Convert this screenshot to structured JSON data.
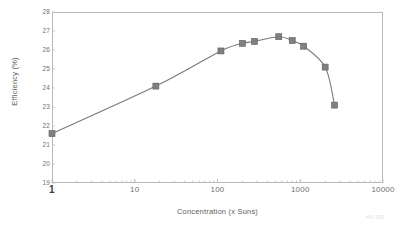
{
  "chart_data": {
    "type": "line",
    "title": "",
    "xlabel": "Concentration (x Suns)",
    "ylabel": "Efficiency (%)",
    "xscale": "log",
    "xlim": [
      1,
      10000
    ],
    "ylim": [
      19,
      28
    ],
    "grid": false,
    "legend": null,
    "marker": "square",
    "series": [
      {
        "name": "Efficiency",
        "color": "#808080",
        "points": [
          {
            "x": 1,
            "y": 21.6
          },
          {
            "x": 18,
            "y": 24.1
          },
          {
            "x": 110,
            "y": 25.95
          },
          {
            "x": 200,
            "y": 26.35
          },
          {
            "x": 280,
            "y": 26.45
          },
          {
            "x": 550,
            "y": 26.7
          },
          {
            "x": 800,
            "y": 26.5
          },
          {
            "x": 1100,
            "y": 26.2
          },
          {
            "x": 2000,
            "y": 25.1
          },
          {
            "x": 2600,
            "y": 23.1
          }
        ]
      }
    ],
    "yticks": [
      19,
      20,
      21,
      22,
      23,
      24,
      25,
      26,
      27,
      28
    ],
    "ytick_labels": [
      "19",
      "20",
      "21",
      "22",
      "23",
      "24",
      "25",
      "26",
      "27",
      "28"
    ],
    "xticks": [
      1,
      10,
      100,
      1000,
      10000
    ],
    "xtick_labels": [
      "1",
      "10",
      "100",
      "1000",
      "10000"
    ]
  },
  "axes": {
    "x_title": "Concentration (x Suns)",
    "y_title": "Efficiency (%)"
  },
  "watermark": {
    "text": "HK-301"
  },
  "colors": {
    "marker": "#808080",
    "line": "#7a7a7a",
    "frame": "#b9b9b9",
    "tick_text": "#6f6f6f"
  }
}
